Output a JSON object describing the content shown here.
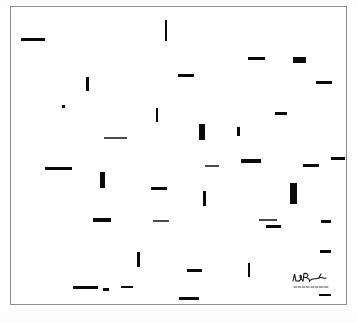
{
  "artwork": {
    "title": "Untitled abstract composition",
    "medium_appearance": "black dashes on white ground",
    "frame": {
      "border_color": "#8d8d8d",
      "background_color": "#ffffff",
      "left": 10,
      "top": 6,
      "width": 337,
      "height": 299
    },
    "ink_color": "#0a0a0a",
    "ground_color": "#ffffff",
    "signature": {
      "present": true,
      "position": "bottom-right",
      "legible_text": "",
      "description": "handwritten artist signature with dated inscription beneath"
    },
    "marks": [
      {
        "x": 20,
        "y": 37,
        "w": 24,
        "h": 3,
        "tone": "ink"
      },
      {
        "x": 164,
        "y": 19,
        "w": 2,
        "h": 21,
        "tone": "ink"
      },
      {
        "x": 85,
        "y": 76,
        "w": 3,
        "h": 14,
        "tone": "ink"
      },
      {
        "x": 177,
        "y": 73,
        "w": 16,
        "h": 3,
        "tone": "ink"
      },
      {
        "x": 247,
        "y": 56,
        "w": 17,
        "h": 3,
        "tone": "ink"
      },
      {
        "x": 292,
        "y": 56,
        "w": 13,
        "h": 6,
        "tone": "ink"
      },
      {
        "x": 315,
        "y": 80,
        "w": 16,
        "h": 3,
        "tone": "ink"
      },
      {
        "x": 61,
        "y": 104,
        "w": 3,
        "h": 3,
        "tone": "ink"
      },
      {
        "x": 155,
        "y": 107,
        "w": 2,
        "h": 14,
        "tone": "ink"
      },
      {
        "x": 103,
        "y": 136,
        "w": 23,
        "h": 2,
        "tone": "faint"
      },
      {
        "x": 198,
        "y": 123,
        "w": 6,
        "h": 16,
        "tone": "ink"
      },
      {
        "x": 236,
        "y": 126,
        "w": 3,
        "h": 9,
        "tone": "ink"
      },
      {
        "x": 274,
        "y": 111,
        "w": 12,
        "h": 3,
        "tone": "ink"
      },
      {
        "x": 44,
        "y": 166,
        "w": 27,
        "h": 3,
        "tone": "ink"
      },
      {
        "x": 99,
        "y": 171,
        "w": 5,
        "h": 16,
        "tone": "ink"
      },
      {
        "x": 240,
        "y": 158,
        "w": 20,
        "h": 4,
        "tone": "ink"
      },
      {
        "x": 302,
        "y": 163,
        "w": 16,
        "h": 3,
        "tone": "ink"
      },
      {
        "x": 330,
        "y": 156,
        "w": 14,
        "h": 3,
        "tone": "ink"
      },
      {
        "x": 150,
        "y": 186,
        "w": 16,
        "h": 3,
        "tone": "ink"
      },
      {
        "x": 202,
        "y": 190,
        "w": 3,
        "h": 15,
        "tone": "ink"
      },
      {
        "x": 289,
        "y": 182,
        "w": 7,
        "h": 21,
        "tone": "ink"
      },
      {
        "x": 204,
        "y": 164,
        "w": 14,
        "h": 2,
        "tone": "faint"
      },
      {
        "x": 92,
        "y": 217,
        "w": 18,
        "h": 4,
        "tone": "ink"
      },
      {
        "x": 152,
        "y": 219,
        "w": 16,
        "h": 2,
        "tone": "faint"
      },
      {
        "x": 258,
        "y": 218,
        "w": 18,
        "h": 2,
        "tone": "faint"
      },
      {
        "x": 265,
        "y": 224,
        "w": 15,
        "h": 3,
        "tone": "ink"
      },
      {
        "x": 320,
        "y": 219,
        "w": 10,
        "h": 3,
        "tone": "ink"
      },
      {
        "x": 136,
        "y": 251,
        "w": 3,
        "h": 15,
        "tone": "ink"
      },
      {
        "x": 186,
        "y": 268,
        "w": 15,
        "h": 3,
        "tone": "ink"
      },
      {
        "x": 247,
        "y": 262,
        "w": 2,
        "h": 14,
        "tone": "ink"
      },
      {
        "x": 319,
        "y": 249,
        "w": 11,
        "h": 3,
        "tone": "ink"
      },
      {
        "x": 72,
        "y": 285,
        "w": 25,
        "h": 3,
        "tone": "ink"
      },
      {
        "x": 102,
        "y": 287,
        "w": 6,
        "h": 3,
        "tone": "ink"
      },
      {
        "x": 120,
        "y": 285,
        "w": 12,
        "h": 2,
        "tone": "ink"
      },
      {
        "x": 178,
        "y": 296,
        "w": 20,
        "h": 3,
        "tone": "ink"
      },
      {
        "x": 318,
        "y": 293,
        "w": 12,
        "h": 2,
        "tone": "ink"
      }
    ]
  }
}
